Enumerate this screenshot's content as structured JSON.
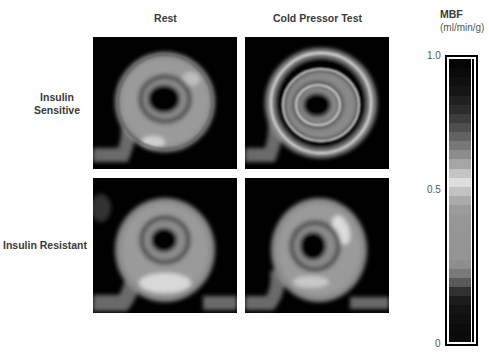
{
  "figure": {
    "columns": [
      "Rest",
      "Cold Pressor Test"
    ],
    "rows": [
      {
        "label_line1": "Insulin",
        "label_line2": "Sensitive"
      },
      {
        "label_line1": "Insulin Resistant",
        "label_line2": ""
      }
    ],
    "panels": [
      {
        "row": "Insulin Sensitive",
        "column": "Rest",
        "description": "myocardial perfusion short-axis ring"
      },
      {
        "row": "Insulin Sensitive",
        "column": "Cold Pressor Test",
        "description": "myocardial perfusion short-axis ring, brighter outlines"
      },
      {
        "row": "Insulin Resistant",
        "column": "Rest",
        "description": "myocardial perfusion short-axis ring, bright inferior wall"
      },
      {
        "row": "Insulin Resistant",
        "column": "Cold Pressor Test",
        "description": "myocardial perfusion short-axis ring, bright lateral wall"
      }
    ]
  },
  "colorbar": {
    "title": "MBF",
    "unit": "(ml/min/g)",
    "ticks": [
      "1.0",
      "0.5",
      "0"
    ],
    "bands": [
      "#050505",
      "#0a0a0a",
      "#101010",
      "#161616",
      "#202020",
      "#2c2c2c",
      "#3c3c3c",
      "#4e4e4e",
      "#626262",
      "#777777",
      "#8c8c8c",
      "#a5a5a5",
      "#c4c4c4",
      "#dedede",
      "#c2c2c2",
      "#aaaaaa",
      "#9c9c9c",
      "#989898",
      "#969696",
      "#959595",
      "#959595",
      "#949494",
      "#8e8e8e",
      "#7a7a7a",
      "#5a5a5a",
      "#303030",
      "#1c1c1c",
      "#141414",
      "#101010",
      "#0c0c0c",
      "#0a0a0a"
    ]
  }
}
